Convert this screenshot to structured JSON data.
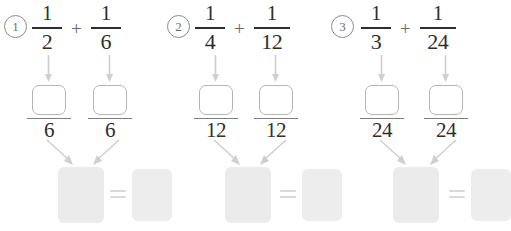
{
  "page": {
    "background_color": "#ffffff",
    "ink_color": "#2e2e2e",
    "box_outline_color": "#b5b5b5",
    "result_fill_color": "#ebebeb",
    "arrow_color": "#c9c9c9"
  },
  "problems": [
    {
      "index": "1",
      "left_fraction": {
        "numerator": "1",
        "denominator": "2"
      },
      "operator": "+",
      "right_fraction": {
        "numerator": "1",
        "denominator": "6"
      },
      "converted": {
        "left": {
          "numerator": "",
          "denominator": "6"
        },
        "right": {
          "numerator": "",
          "denominator": "6"
        }
      },
      "result": {
        "sum_box": "",
        "equals": "=",
        "answer_box": ""
      }
    },
    {
      "index": "2",
      "left_fraction": {
        "numerator": "1",
        "denominator": "4"
      },
      "operator": "+",
      "right_fraction": {
        "numerator": "1",
        "denominator": "12"
      },
      "converted": {
        "left": {
          "numerator": "",
          "denominator": "12"
        },
        "right": {
          "numerator": "",
          "denominator": "12"
        }
      },
      "result": {
        "sum_box": "",
        "equals": "=",
        "answer_box": ""
      }
    },
    {
      "index": "3",
      "left_fraction": {
        "numerator": "1",
        "denominator": "3"
      },
      "operator": "+",
      "right_fraction": {
        "numerator": "1",
        "denominator": "24"
      },
      "converted": {
        "left": {
          "numerator": "",
          "denominator": "24"
        },
        "right": {
          "numerator": "",
          "denominator": "24"
        }
      },
      "result": {
        "sum_box": "",
        "equals": "=",
        "answer_box": ""
      }
    }
  ]
}
